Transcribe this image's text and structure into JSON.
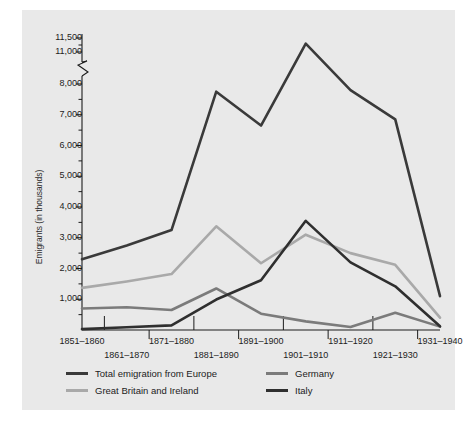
{
  "figure": {
    "panel_color": "#e9e9e9",
    "page_color": "#ffffff",
    "axis_color": "#1c1c1c",
    "ylabel": "Emigrants (in thousands)"
  },
  "chart_data": {
    "type": "line",
    "title": "",
    "xlabel": "",
    "ylabel": "Emigrants (in thousands)",
    "grid": false,
    "legend_position": "bottom",
    "axis_break": {
      "present": true,
      "below": 8000,
      "above": 11000
    },
    "ylim": [
      0,
      11500
    ],
    "ytick_labels": [
      "1,000",
      "2,000",
      "3,000",
      "4,000",
      "5,000",
      "6,000",
      "7,000",
      "8,000",
      "11,000",
      "11,500"
    ],
    "ytick_values": [
      1000,
      2000,
      3000,
      4000,
      5000,
      6000,
      7000,
      8000,
      11000,
      11500
    ],
    "yminor_values": [
      500,
      1500,
      2500,
      3500,
      4500,
      5500,
      6500,
      7500,
      11250
    ],
    "categories": [
      "1851–1860",
      "1861–1870",
      "1871–1880",
      "1881–1890",
      "1891–1900",
      "1901–1910",
      "1911–1920",
      "1921–1930",
      "1931–1940"
    ],
    "series": [
      {
        "name": "Total emigration from Europe",
        "color": "#3a3a3a",
        "values": [
          2300,
          2750,
          3250,
          7750,
          6650,
          11300,
          7800,
          6850,
          1100
        ]
      },
      {
        "name": "Great Britain and Ireland",
        "color": "#a9a9a9",
        "values": [
          1370,
          1580,
          1820,
          3370,
          2170,
          3100,
          2500,
          2120,
          400
        ]
      },
      {
        "name": "Germany",
        "color": "#7b7b7b",
        "values": [
          700,
          740,
          650,
          1350,
          530,
          280,
          100,
          560,
          110
        ]
      },
      {
        "name": "Italy",
        "color": "#2f2f2f",
        "values": [
          30,
          90,
          150,
          990,
          1620,
          3550,
          2200,
          1420,
          120
        ]
      }
    ]
  },
  "legend": {
    "items": [
      {
        "label": "Total emigration from Europe",
        "color": "#3a3a3a"
      },
      {
        "label": "Germany",
        "color": "#7b7b7b"
      },
      {
        "label": "Great Britain and Ireland",
        "color": "#a9a9a9"
      },
      {
        "label": "Italy",
        "color": "#2f2f2f"
      }
    ]
  }
}
